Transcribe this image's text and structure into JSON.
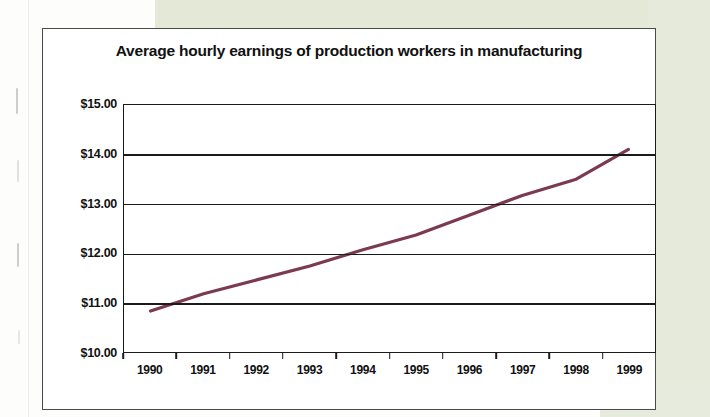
{
  "document": {
    "kind": "scanned-chart-page",
    "background_color": "#e4e9d7",
    "page_color": "#fdfdfb"
  },
  "chart_data": {
    "type": "line",
    "title": "Average hourly earnings of production workers in manufacturing",
    "xlabel": "",
    "ylabel": "",
    "categories": [
      "1990",
      "1991",
      "1992",
      "1993",
      "1994",
      "1995",
      "1996",
      "1997",
      "1998",
      "1999"
    ],
    "x": [
      1990,
      1991,
      1992,
      1993,
      1994,
      1995,
      1996,
      1997,
      1998,
      1999
    ],
    "values": [
      10.83,
      11.18,
      11.46,
      11.74,
      12.07,
      12.37,
      12.77,
      13.17,
      13.49,
      14.1
    ],
    "series": [
      {
        "name": "Average hourly earnings",
        "color": "#7b3a52",
        "values": [
          10.83,
          11.18,
          11.46,
          11.74,
          12.07,
          12.37,
          12.77,
          13.17,
          13.49,
          14.1
        ]
      }
    ],
    "ylim": [
      10.0,
      15.0
    ],
    "ytick_values": [
      15.0,
      14.0,
      13.0,
      12.0,
      11.0,
      10.0
    ],
    "ytick_labels": [
      "$15.00",
      "$14.00",
      "$13.00",
      "$12.00",
      "$11.00",
      "$10.00"
    ],
    "xtick_labels": [
      "1990",
      "1991",
      "1992",
      "1993",
      "1994",
      "1995",
      "1996",
      "1997",
      "1998",
      "1999"
    ],
    "grid": true,
    "grid_axis": "y",
    "legend": false,
    "legend_position": "none",
    "line_color": "#7b3a52",
    "axis_color": "#1b1b1b"
  }
}
